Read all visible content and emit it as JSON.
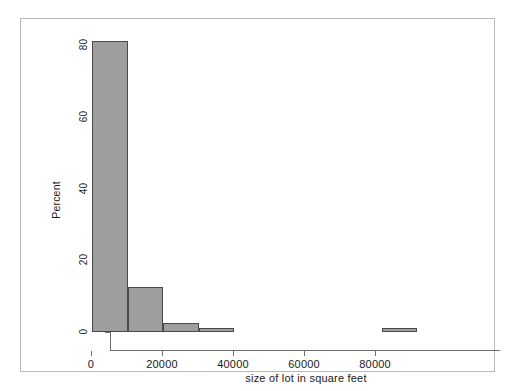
{
  "chart_data": {
    "type": "bar",
    "title": "",
    "subtitle": "",
    "xlabel": "size of lot in square feet",
    "ylabel": "Percent",
    "xlim": [
      0,
      93500
    ],
    "ylim": [
      0,
      85
    ],
    "grid": false,
    "legend": null,
    "bin_width": 10000,
    "xticks": [
      0,
      20000,
      40000,
      60000,
      80000
    ],
    "xtick_labels": [
      "0",
      "20000",
      "40000",
      "60000",
      "80000"
    ],
    "yticks": [
      0,
      20,
      40,
      60,
      80
    ],
    "ytick_labels": [
      "0",
      "20",
      "40",
      "60",
      "80"
    ],
    "bars": [
      {
        "label": "0-10000",
        "x_start": 300,
        "x_end": 10300,
        "value": 81.0
      },
      {
        "label": "10000-20000",
        "x_start": 10300,
        "x_end": 20300,
        "value": 12.5
      },
      {
        "label": "20000-30000",
        "x_start": 20300,
        "x_end": 30300,
        "value": 2.5
      },
      {
        "label": "30000-40000",
        "x_start": 30300,
        "x_end": 40300,
        "value": 1.2
      },
      {
        "label": "80000-90000",
        "x_start": 82000,
        "x_end": 91700,
        "value": 1.2
      }
    ],
    "colors": {
      "bar_fill": "#9e9e9e",
      "bar_edge": "#4a4a4a",
      "axis": "#6f6f6f",
      "text": "#1a1a1a",
      "frame": "#b9b9b9",
      "background": "#ffffff"
    }
  }
}
